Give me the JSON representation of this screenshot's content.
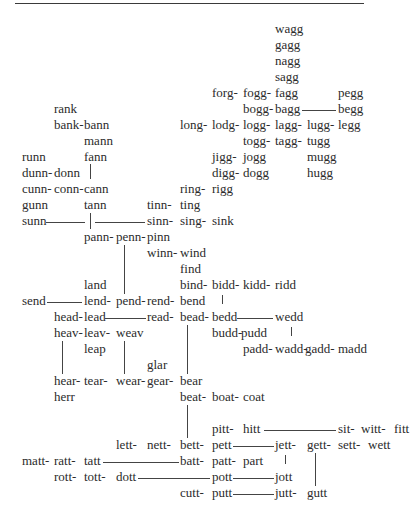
{
  "diagram": {
    "type": "word-derivation-network",
    "rows": [
      [
        "wagg"
      ],
      [
        "gagg"
      ],
      [
        "nagg"
      ],
      [
        "sagg"
      ],
      [
        "forg-",
        "fogg-",
        "fagg",
        "pegg"
      ],
      [
        "rank",
        "bogg-",
        "bagg",
        "begg"
      ],
      [
        "bank-",
        "bann",
        "long-",
        "lodg-",
        "logg-",
        "lagg-",
        "lugg-",
        "legg"
      ],
      [
        "mann",
        "togg-",
        "tagg-",
        "tugg"
      ],
      [
        "runn",
        "fann",
        "jigg-",
        "jogg",
        "mugg"
      ],
      [
        "dunn-",
        "donn",
        "digg-",
        "dogg",
        "hugg"
      ],
      [
        "cunn-",
        "conn-",
        "cann",
        "ring-",
        "rigg"
      ],
      [
        "gunn",
        "tann",
        "tinn-",
        "ting"
      ],
      [
        "sunn",
        "sinn-",
        "sing-",
        "sink"
      ],
      [
        "pann-",
        "penn-",
        "pinn"
      ],
      [
        "winn-",
        "wind"
      ],
      [
        "find"
      ],
      [
        "land",
        "bind-",
        "bidd-",
        "kidd-",
        "ridd"
      ],
      [
        "send",
        "lend-",
        "pend-",
        "rend-",
        "bend"
      ],
      [
        "head-",
        "lead",
        "read-",
        "bead-",
        "bedd",
        "wedd"
      ],
      [
        "heav-",
        "leav-",
        "weav",
        "budd-",
        "pudd"
      ],
      [
        "leap",
        "padd-",
        "wadd-",
        "gadd-",
        "madd"
      ],
      [
        "glar"
      ],
      [
        "hear-",
        "tear-",
        "wear-",
        "gear-",
        "bear"
      ],
      [
        "herr",
        "beat-",
        "boat-",
        "coat"
      ],
      [
        "pitt-",
        "hitt",
        "sit-",
        "witt-",
        "fitt"
      ],
      [
        "lett-",
        "nett-",
        "bett-",
        "pett",
        "jett-",
        "gett-",
        "sett-",
        "wett"
      ],
      [
        "matt-",
        "ratt-",
        "tatt",
        "batt-",
        "patt-",
        "part"
      ],
      [
        "rott-",
        "tott-",
        "dott",
        "pott",
        "jott"
      ],
      [
        "cutt-",
        "putt",
        "jutt-",
        "gutt"
      ]
    ]
  },
  "words": {
    "wagg": "wagg",
    "gagg": "gagg",
    "nagg": "nagg",
    "sagg": "sagg",
    "forg": "forg-",
    "fogg": "fogg-",
    "fagg": "fagg",
    "pegg": "pegg",
    "rank": "rank",
    "bogg": "bogg-",
    "bagg": "bagg",
    "begg": "begg",
    "bank": "bank-",
    "bann": "bann",
    "long": "long-",
    "lodg": "lodg-",
    "logg": "logg-",
    "lagg": "lagg-",
    "lugg": "lugg-",
    "legg": "legg",
    "mann": "mann",
    "togg": "togg-",
    "tagg": "tagg-",
    "tugg": "tugg",
    "runn": "runn",
    "fann": "fann",
    "jigg": "jigg-",
    "jogg": "jogg",
    "mugg": "mugg",
    "dunn": "dunn-",
    "donn": "donn",
    "digg": "digg-",
    "dogg": "dogg",
    "hugg": "hugg",
    "cunn": "cunn-",
    "conn": "conn-",
    "cann": "cann",
    "ring": "ring-",
    "rigg": "rigg",
    "gunn": "gunn",
    "tann": "tann",
    "tinn": "tinn-",
    "ting": "ting",
    "sunn": "sunn",
    "sinn": "sinn-",
    "sing": "sing-",
    "sink": "sink",
    "pann": "pann-",
    "penn": "penn-",
    "pinn": "pinn",
    "winn": "winn-",
    "wind": "wind",
    "find": "find",
    "land": "land",
    "bind": "bind-",
    "bidd": "bidd-",
    "kidd": "kidd-",
    "ridd": "ridd",
    "send": "send",
    "lend": "lend-",
    "pend": "pend-",
    "rend": "rend-",
    "bend": "bend",
    "head": "head-",
    "lead": "lead",
    "read": "read-",
    "bead": "bead-",
    "bedd": "bedd",
    "wedd": "wedd",
    "heav": "heav-",
    "leav": "leav-",
    "weav": "weav",
    "budd": "budd-",
    "pudd": "pudd",
    "leap": "leap",
    "padd": "padd-",
    "wadd": "wadd-",
    "gadd": "gadd-",
    "madd": "madd",
    "glar": "glar",
    "hear": "hear-",
    "tear": "tear-",
    "wear": "wear-",
    "gear": "gear-",
    "bear": "bear",
    "herr": "herr",
    "beat": "beat-",
    "boat": "boat-",
    "coat": "coat",
    "pitt": "pitt-",
    "hitt": "hitt",
    "sit": "sit-",
    "witt": "witt-",
    "fitt": "fitt",
    "lett": "lett-",
    "nett": "nett-",
    "bett": "bett-",
    "pett": "pett",
    "jett": "jett-",
    "gett": "gett-",
    "sett": "sett-",
    "wett": "wett",
    "matt": "matt-",
    "ratt": "ratt-",
    "tatt": "tatt",
    "batt": "batt-",
    "patt": "patt-",
    "part": "part",
    "rott": "rott-",
    "tott": "tott-",
    "dott": "dott",
    "pott": "pott",
    "jott": "jott",
    "cutt": "cutt-",
    "putt": "putt",
    "jutt": "jutt-",
    "gutt": "gutt"
  }
}
